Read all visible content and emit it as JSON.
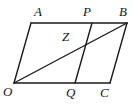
{
  "figure": {
    "kind": "geometry-diagram",
    "shape": "parallelogram-with-cevian-and-transversal",
    "stroke_color": "#1a1a1a",
    "background_color": "#ffffff",
    "width": 137,
    "height": 107,
    "points": {
      "A": {
        "label": "A",
        "x": 31,
        "y": 23,
        "label_x": 34,
        "label_y": 5
      },
      "B": {
        "label": "B",
        "x": 127,
        "y": 23,
        "label_x": 119,
        "label_y": 5
      },
      "O": {
        "label": "O",
        "x": 14,
        "y": 83,
        "label_x": 3,
        "label_y": 85
      },
      "C": {
        "label": "C",
        "x": 110,
        "y": 83,
        "label_x": 100,
        "label_y": 86
      },
      "P": {
        "label": "P",
        "x": 92,
        "y": 23,
        "label_x": 83,
        "label_y": 5
      },
      "Q": {
        "label": "Q",
        "x": 75,
        "y": 83,
        "label_x": 66,
        "label_y": 86
      },
      "Z": {
        "label": "Z",
        "x": 83,
        "y": 46,
        "label_x": 62,
        "label_y": 30
      }
    },
    "segments": [
      {
        "name": "side-AB",
        "x1": 31,
        "y1": 23,
        "x2": 127,
        "y2": 23
      },
      {
        "name": "side-OC",
        "x1": 14,
        "y1": 83,
        "x2": 110,
        "y2": 83
      },
      {
        "name": "side-OA",
        "x1": 14,
        "y1": 83,
        "x2": 31,
        "y2": 23
      },
      {
        "name": "side-CB",
        "x1": 110,
        "y1": 83,
        "x2": 127,
        "y2": 23
      },
      {
        "name": "diagonal-OB",
        "x1": 14,
        "y1": 83,
        "x2": 127,
        "y2": 23
      },
      {
        "name": "transversal-PQ",
        "x1": 92,
        "y1": 23,
        "x2": 75,
        "y2": 83
      }
    ]
  }
}
